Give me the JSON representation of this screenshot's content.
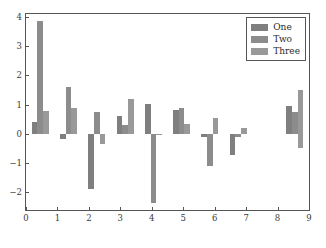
{
  "chart_data": {
    "type": "bar",
    "title": "",
    "xlabel": "",
    "ylabel": "",
    "xlim": [
      0,
      9
    ],
    "ylim": [
      -2.6,
      4.1
    ],
    "grid": false,
    "legend_position": "upper right",
    "xticks": [
      "0",
      "1",
      "2",
      "3",
      "4",
      "5",
      "6",
      "7",
      "8",
      "9"
    ],
    "yticks": [
      "4",
      "3",
      "2",
      "1",
      "0",
      "-1",
      "-2"
    ],
    "categories": [
      "0",
      "1",
      "2",
      "3",
      "4",
      "5",
      "6",
      "7",
      "8"
    ],
    "group_centers": [
      0.45,
      1.35,
      2.25,
      3.15,
      4.05,
      4.95,
      5.85,
      6.75,
      8.55
    ],
    "series": [
      {
        "name": "One",
        "color": "#7f7f7f",
        "values": [
          0.42,
          -0.16,
          -1.87,
          0.62,
          1.03,
          0.82,
          -0.12,
          -0.72,
          0.96
        ]
      },
      {
        "name": "Two",
        "color": "#8c8c8c",
        "values": [
          3.87,
          1.6,
          0.74,
          0.3,
          -2.35,
          0.88,
          -1.1,
          -0.1,
          0.56
        ]
      },
      {
        "name": "Three",
        "color": "#999999",
        "values": [
          0.78,
          0.87,
          -0.33,
          1.2,
          -0.04,
          0.35,
          0.53,
          0.2,
          -0.48
        ]
      }
    ],
    "last_group": {
      "center": 8.55,
      "values": [
        0.74,
        0.74,
        1.5
      ]
    },
    "bar_width": 0.18
  },
  "legend": {
    "entries": [
      {
        "label": "One"
      },
      {
        "label": "Two"
      },
      {
        "label": "Three"
      }
    ]
  }
}
